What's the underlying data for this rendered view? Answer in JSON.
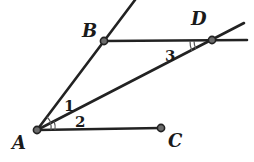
{
  "diagram": {
    "type": "geometry",
    "points": {
      "A": {
        "label": "A",
        "x": 37,
        "y": 130
      },
      "B": {
        "label": "B",
        "x": 104,
        "y": 41
      },
      "C": {
        "label": "C",
        "x": 161,
        "y": 128
      },
      "D": {
        "label": "D",
        "x": 212,
        "y": 40
      }
    },
    "angles": {
      "angle1": {
        "label": "1"
      },
      "angle2": {
        "label": "2"
      },
      "angle3": {
        "label": "3"
      }
    },
    "segments": [
      "ray AB",
      "line BD",
      "ray AD",
      "segment AC"
    ],
    "colors": {
      "line": "#222222",
      "dot": "#6b6b6b",
      "background": "#ffffff"
    }
  }
}
